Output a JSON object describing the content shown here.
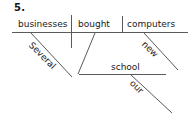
{
  "figure": {
    "item_number": "5.",
    "type": "reed-kellogg-sentence-diagram",
    "sentence": "Several businesses bought new computers for our school."
  },
  "diagram": {
    "baseline": {
      "subject": "businesses",
      "verb": "bought",
      "direct_object": "computers"
    },
    "modifiers": [
      {
        "word": "Several",
        "modifies": "businesses",
        "slant": "down-right"
      },
      {
        "word": "new",
        "modifies": "computers",
        "slant": "down-right"
      },
      {
        "word": "our",
        "modifies": "school",
        "slant": "down-right"
      }
    ],
    "prepositional_phrase": {
      "object": "school"
    }
  },
  "ink": {
    "line_color": "#5a5a5a",
    "text_color": "#1a1a1a",
    "background": "#ffffff"
  }
}
